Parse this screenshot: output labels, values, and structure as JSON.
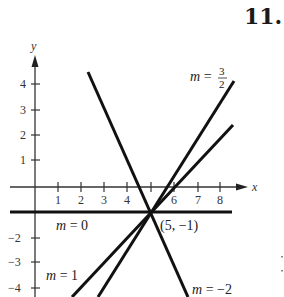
{
  "problem_number": "11.",
  "axes": {
    "x_label": "x",
    "y_label": "y",
    "x_ticks": [
      "1",
      "2",
      "3",
      "4",
      "5",
      "6",
      "7",
      "8"
    ],
    "x_tick_labels_shown": [
      "1",
      "2",
      "3",
      "4",
      "6",
      "7",
      "8"
    ],
    "y_ticks_positive": [
      "1",
      "2",
      "3",
      "4"
    ],
    "y_ticks_negative": [
      "−2",
      "−3",
      "−4"
    ]
  },
  "point": {
    "label": "(5, −1)",
    "x": 5,
    "y": -1
  },
  "lines": [
    {
      "name": "m0",
      "label_m": "m",
      "label_eq": " = 0",
      "slope": 0
    },
    {
      "name": "m1",
      "label_m": "m",
      "label_eq": " = 1",
      "slope": 1
    },
    {
      "name": "m32",
      "label_m": "m",
      "label_eq": " = ",
      "num": "3",
      "den": "2",
      "slope": 1.5
    },
    {
      "name": "mneg2",
      "label_m": "m",
      "label_eq": " = −2",
      "slope": -2
    }
  ],
  "colors": {
    "ink": "#1a1a1a",
    "background": "#ffffff"
  }
}
